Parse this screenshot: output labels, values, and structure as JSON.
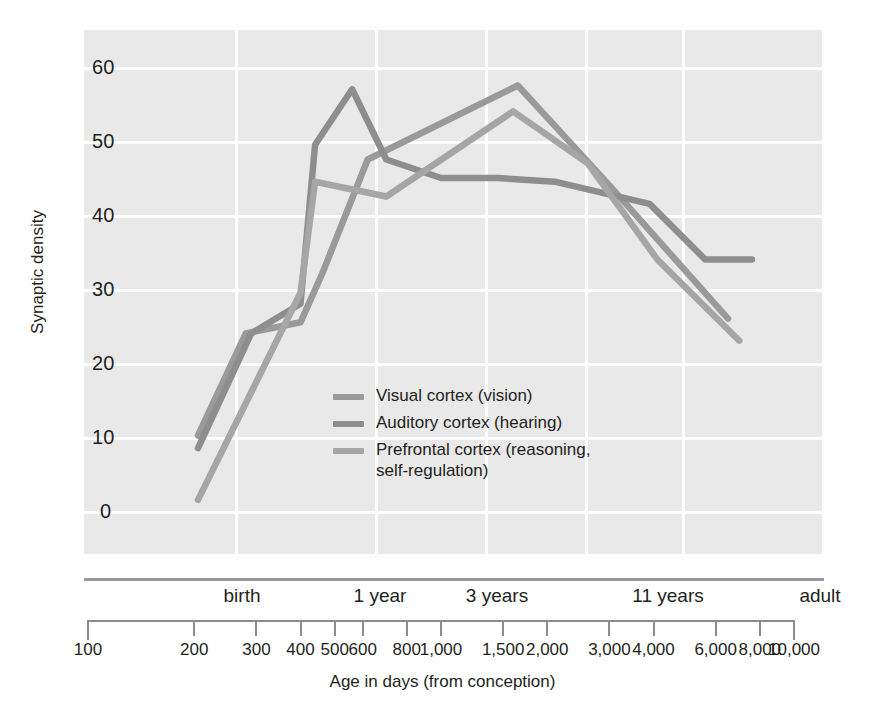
{
  "chart_data": {
    "type": "line",
    "title": "",
    "xlabel": "Age in days (from conception)",
    "ylabel": "Synaptic density",
    "x_scale": "log",
    "xlim": [
      100,
      10000
    ],
    "ylim": [
      0,
      63
    ],
    "grid": true,
    "legend_position": "inside-center-left",
    "y_ticks": [
      0,
      10,
      20,
      30,
      40,
      50,
      60
    ],
    "x_ticks": [
      "100",
      "200",
      "300",
      "400",
      "500",
      "600",
      "800",
      "1,000",
      "1,500",
      "2,000",
      "3,000",
      "4,000",
      "6,000",
      "8,000",
      "10,000"
    ],
    "x_tick_values": [
      100,
      200,
      300,
      400,
      500,
      600,
      800,
      1000,
      1500,
      2000,
      3000,
      4000,
      6000,
      8000,
      10000
    ],
    "x_stage_labels": [
      "birth",
      "1 year",
      "3 years",
      "11 years",
      "adult"
    ],
    "x_stage_values": [
      266,
      630,
      1360,
      4200,
      10000
    ],
    "series": [
      {
        "name": "Visual cortex (vision)",
        "color": "#9a9a9a",
        "x": [
          205,
          280,
          400,
          460,
          620,
          1650,
          3000,
          6500
        ],
        "y": [
          10.2,
          24.0,
          25.5,
          32.0,
          47.5,
          57.5,
          44.0,
          26.0
        ]
      },
      {
        "name": "Auditory cortex (hearing)",
        "color": "#8e8e8e",
        "x": [
          205,
          290,
          400,
          440,
          560,
          700,
          1000,
          1450,
          2100,
          3900,
          5600,
          7600
        ],
        "y": [
          8.5,
          24.0,
          28.0,
          49.5,
          57.0,
          47.5,
          45.0,
          45.0,
          44.5,
          41.5,
          34.0,
          34.0
        ]
      },
      {
        "name": "Prefrontal cortex (reasoning, self-regulation)",
        "color": "#a6a6a6",
        "x": [
          205,
          400,
          440,
          700,
          1600,
          2600,
          4100,
          7000
        ],
        "y": [
          1.5,
          29.5,
          44.5,
          42.5,
          54.0,
          47.0,
          34.0,
          23.0
        ]
      }
    ]
  },
  "legend": {
    "items": [
      {
        "label": "Visual cortex (vision)",
        "continuation": ""
      },
      {
        "label": "Auditory cortex (hearing)",
        "continuation": ""
      },
      {
        "label": "Prefrontal cortex (reasoning,",
        "continuation": "self-regulation)"
      }
    ]
  },
  "colors": {
    "plot_background": "#e9e9e9",
    "gridline": "#fdfdfd",
    "axis": "#9b9a99",
    "text": "#231f20",
    "page_background": "#ffffff"
  }
}
